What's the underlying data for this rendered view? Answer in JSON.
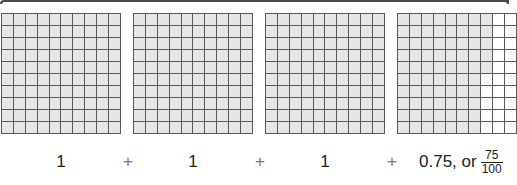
{
  "colors": {
    "shaded": "#e6e6e6",
    "unshaded": "#ffffff",
    "gridline": "#5a5a5a",
    "frame": "#4a4a4a"
  },
  "grids": [
    {
      "rows": 10,
      "cols": 10,
      "shaded_count": 100,
      "value_label": "1"
    },
    {
      "rows": 10,
      "cols": 10,
      "shaded_count": 100,
      "value_label": "1"
    },
    {
      "rows": 10,
      "cols": 10,
      "shaded_count": 100,
      "value_label": "1"
    },
    {
      "rows": 10,
      "cols": 10,
      "shaded_count": 75,
      "shaded_full_columns": 7,
      "partial_column_shaded_rows": 5,
      "value_label": "0.75, or",
      "fraction": {
        "numerator": "75",
        "denominator": "100"
      }
    }
  ],
  "operators": [
    "+",
    "+",
    "+"
  ]
}
